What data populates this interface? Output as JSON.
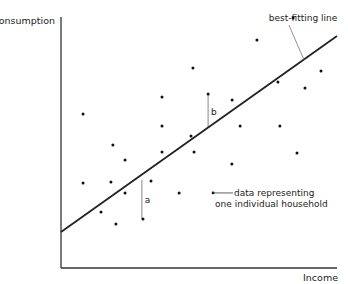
{
  "chart_data": {
    "type": "scatter",
    "title": "",
    "xlabel": "Income",
    "ylabel": "Consumption",
    "xlim": [
      0,
      100
    ],
    "ylim": [
      0,
      100
    ],
    "grid": false,
    "series": [
      {
        "name": "data representing one individual household",
        "points": [
          [
            8.0,
            61.4
          ],
          [
            18.8,
            49.0
          ],
          [
            23.2,
            43.0
          ],
          [
            8.0,
            33.9
          ],
          [
            18.1,
            34.3
          ],
          [
            23.2,
            29.9
          ],
          [
            32.6,
            34.7
          ],
          [
            14.5,
            22.3
          ],
          [
            19.9,
            17.5
          ],
          [
            29.7,
            19.5
          ],
          [
            36.6,
            68.1
          ],
          [
            36.6,
            56.6
          ],
          [
            36.6,
            46.2
          ],
          [
            47.8,
            79.7
          ],
          [
            47.1,
            52.6
          ],
          [
            48.2,
            46.2
          ],
          [
            53.3,
            69.3
          ],
          [
            62.0,
            66.9
          ],
          [
            64.9,
            56.6
          ],
          [
            61.9,
            41.4
          ],
          [
            42.8,
            29.9
          ],
          [
            71.0,
            90.8
          ],
          [
            79.3,
            56.6
          ],
          [
            85.5,
            45.8
          ],
          [
            84.1,
            99.6
          ],
          [
            94.2,
            78.5
          ],
          [
            88.4,
            71.7
          ],
          [
            78.6,
            74.1
          ]
        ]
      }
    ],
    "fit_line": {
      "name": "best-fitting line",
      "from": [
        0,
        14.3
      ],
      "to": [
        100,
        92.4
      ]
    },
    "annotations": [
      {
        "label": "a",
        "type": "residual",
        "x": 29.3,
        "y_point": 19.5,
        "y_line": 35.1
      },
      {
        "label": "b",
        "type": "residual",
        "x": 53.3,
        "y_point": 69.3,
        "y_line": 55.8
      },
      {
        "label": "best-fitting line",
        "type": "callout",
        "target": "fit_line"
      },
      {
        "label_lines": [
          "data representing",
          "one individual household"
        ],
        "type": "legend-callout",
        "marker_at": [
          55.1,
          29.9
        ]
      }
    ]
  }
}
